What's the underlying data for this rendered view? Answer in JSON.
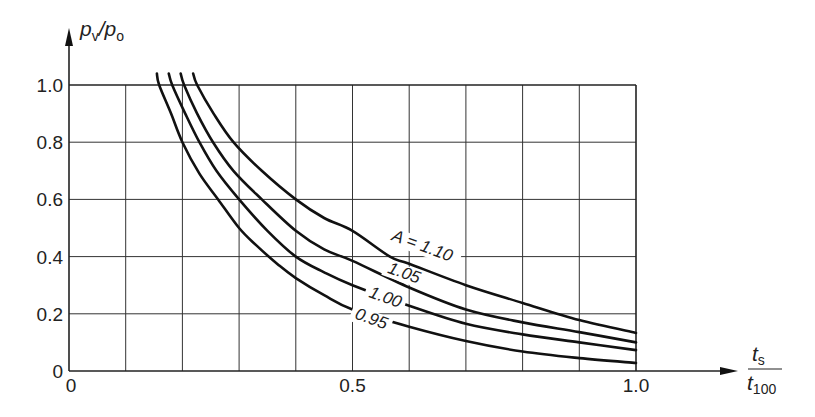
{
  "chart_data": {
    "type": "line",
    "title": "",
    "xlabel": "t_s / t_100",
    "xlabel_parts": {
      "numerator": "t",
      "numerator_sub": "s",
      "denominator": "t",
      "denominator_sub": "100"
    },
    "ylabel": "p_v/p_o",
    "ylabel_parts": {
      "a": "p",
      "a_sub": "v",
      "slash": "/",
      "b": "p",
      "b_sub": "o"
    },
    "xlim": [
      0,
      1.0
    ],
    "ylim": [
      0,
      1.0
    ],
    "x_ticks": [
      {
        "value": 0,
        "label": "0"
      },
      {
        "value": 0.5,
        "label": "0.5"
      },
      {
        "value": 1.0,
        "label": "1.0"
      }
    ],
    "y_ticks": [
      {
        "value": 0,
        "label": "0"
      },
      {
        "value": 0.2,
        "label": "0.2"
      },
      {
        "value": 0.4,
        "label": "0.4"
      },
      {
        "value": 0.6,
        "label": "0.6"
      },
      {
        "value": 0.8,
        "label": "0.8"
      },
      {
        "value": 1.0,
        "label": "1.0"
      }
    ],
    "grid": {
      "on": true,
      "x_step": 0.1,
      "y_step": 0.2
    },
    "legend": {
      "position": "inline curve labels"
    },
    "series": [
      {
        "name": "A = 0.95",
        "label": "0.95",
        "points": [
          [
            0.155,
            1.04
          ],
          [
            0.159,
            1.0
          ],
          [
            0.18,
            0.9
          ],
          [
            0.2,
            0.8
          ],
          [
            0.23,
            0.69
          ],
          [
            0.263,
            0.6
          ],
          [
            0.3,
            0.5
          ],
          [
            0.33,
            0.44
          ],
          [
            0.37,
            0.37
          ],
          [
            0.4,
            0.325
          ],
          [
            0.45,
            0.265
          ],
          [
            0.5,
            0.215
          ],
          [
            0.6,
            0.155
          ],
          [
            0.7,
            0.105
          ],
          [
            0.8,
            0.068
          ],
          [
            0.9,
            0.045
          ],
          [
            1.0,
            0.028
          ]
        ]
      },
      {
        "name": "A = 1.00",
        "label": "1.00",
        "points": [
          [
            0.176,
            1.04
          ],
          [
            0.182,
            1.0
          ],
          [
            0.205,
            0.9
          ],
          [
            0.23,
            0.8
          ],
          [
            0.26,
            0.7
          ],
          [
            0.3,
            0.6
          ],
          [
            0.35,
            0.49
          ],
          [
            0.4,
            0.4
          ],
          [
            0.45,
            0.345
          ],
          [
            0.5,
            0.3
          ],
          [
            0.6,
            0.228
          ],
          [
            0.7,
            0.165
          ],
          [
            0.8,
            0.128
          ],
          [
            0.9,
            0.1
          ],
          [
            1.0,
            0.073
          ]
        ]
      },
      {
        "name": "A = 1.05",
        "label": "1.05",
        "points": [
          [
            0.197,
            1.04
          ],
          [
            0.203,
            1.0
          ],
          [
            0.226,
            0.9
          ],
          [
            0.254,
            0.8
          ],
          [
            0.29,
            0.7
          ],
          [
            0.34,
            0.6
          ],
          [
            0.4,
            0.49
          ],
          [
            0.45,
            0.425
          ],
          [
            0.5,
            0.385
          ],
          [
            0.6,
            0.292
          ],
          [
            0.7,
            0.215
          ],
          [
            0.8,
            0.17
          ],
          [
            0.9,
            0.136
          ],
          [
            1.0,
            0.1
          ]
        ]
      },
      {
        "name": "A = 1.10",
        "label": "A = 1.10",
        "points": [
          [
            0.219,
            1.04
          ],
          [
            0.226,
            1.0
          ],
          [
            0.255,
            0.9
          ],
          [
            0.29,
            0.8
          ],
          [
            0.34,
            0.7
          ],
          [
            0.4,
            0.6
          ],
          [
            0.45,
            0.535
          ],
          [
            0.5,
            0.49
          ],
          [
            0.566,
            0.4
          ],
          [
            0.6,
            0.375
          ],
          [
            0.7,
            0.3
          ],
          [
            0.8,
            0.238
          ],
          [
            0.9,
            0.178
          ],
          [
            1.0,
            0.133
          ]
        ]
      }
    ],
    "annotations": [
      {
        "text": "A = 1.10",
        "x": 0.62,
        "y": 0.42,
        "rotation": 20
      },
      {
        "text": "1.05",
        "x": 0.588,
        "y": 0.325,
        "rotation": 20
      },
      {
        "text": "1.00",
        "x": 0.555,
        "y": 0.24,
        "rotation": 20
      },
      {
        "text": "0.95",
        "x": 0.53,
        "y": 0.165,
        "rotation": 20
      }
    ]
  },
  "layout": {
    "origin_px": [
      69,
      371
    ],
    "x_unit_px": 567,
    "y_unit_px": 286,
    "x_axis_end_px": 738,
    "y_axis_end_px": 28
  }
}
